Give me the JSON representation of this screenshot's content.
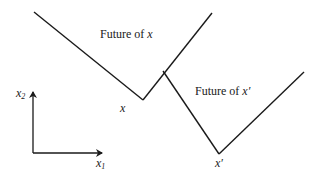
{
  "diagram": {
    "type": "light-cone diagram",
    "stroke_color": "#1a1a1a",
    "background": "#ffffff",
    "cones": [
      {
        "id": "x",
        "region_label_prefix": "Future of ",
        "region_label_var": "x",
        "vertex_label": "x",
        "left_arm": {
          "x1": 34,
          "y1": 12,
          "x2": 143,
          "y2": 100
        },
        "right_arm": {
          "x1": 143,
          "y1": 100,
          "x2": 212,
          "y2": 13
        }
      },
      {
        "id": "x-prime",
        "region_label_prefix": "Future of ",
        "region_label_var": "x′",
        "vertex_label": "x′",
        "left_arm": {
          "x1": 163,
          "y1": 71,
          "x2": 219,
          "y2": 154
        },
        "right_arm": {
          "x1": 219,
          "y1": 154,
          "x2": 304,
          "y2": 72
        }
      }
    ],
    "axes": {
      "vertical_label": "x",
      "vertical_sub": "2",
      "horizontal_label": "x",
      "horizontal_sub": "1",
      "origin": {
        "x": 33,
        "y": 153
      },
      "vertical_end": {
        "x": 33,
        "y": 92
      },
      "horizontal_end": {
        "x": 102,
        "y": 153
      }
    }
  }
}
